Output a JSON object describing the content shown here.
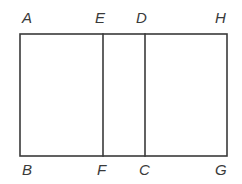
{
  "figure": {
    "kind": "geometry-diagram",
    "canvas": {
      "width": 242,
      "height": 184,
      "background": "#ffffff"
    },
    "style": {
      "stroke_color": "#3a3a3a",
      "stroke_width": 1.6,
      "label_color": "#3a3a3a",
      "label_font_size": 15,
      "label_italic": true
    },
    "rectangle": {
      "left": 20,
      "right": 227,
      "top": 34,
      "bottom": 156,
      "width": 207,
      "height": 122
    },
    "dividers": [
      {
        "name": "EF",
        "x": 103,
        "top": 34,
        "bottom": 156
      },
      {
        "name": "DC",
        "x": 145,
        "top": 34,
        "bottom": 156
      }
    ],
    "edges": [
      {
        "name": "top-edge",
        "from": "A",
        "to": "H"
      },
      {
        "name": "bottom-edge",
        "from": "B",
        "to": "G"
      },
      {
        "name": "left-edge",
        "from": "A",
        "to": "B"
      },
      {
        "name": "right-edge",
        "from": "H",
        "to": "G"
      },
      {
        "name": "divider-EF",
        "from": "E",
        "to": "F"
      },
      {
        "name": "divider-DC",
        "from": "D",
        "to": "C"
      }
    ],
    "labels": [
      {
        "id": "A",
        "text": "A",
        "x": 22,
        "y": 10,
        "position": "above-left-corner"
      },
      {
        "id": "E",
        "text": "E",
        "x": 95,
        "y": 10,
        "position": "above-divider-ef"
      },
      {
        "id": "D",
        "text": "D",
        "x": 136,
        "y": 10,
        "position": "above-divider-dc"
      },
      {
        "id": "H",
        "text": "H",
        "x": 215,
        "y": 10,
        "position": "above-right-corner"
      },
      {
        "id": "B",
        "text": "B",
        "x": 22,
        "y": 162,
        "position": "below-left-corner"
      },
      {
        "id": "F",
        "text": "F",
        "x": 97,
        "y": 162,
        "position": "below-divider-ef"
      },
      {
        "id": "C",
        "text": "C",
        "x": 139,
        "y": 162,
        "position": "below-divider-dc"
      },
      {
        "id": "G",
        "text": "G",
        "x": 215,
        "y": 162,
        "position": "below-right-corner"
      }
    ]
  }
}
